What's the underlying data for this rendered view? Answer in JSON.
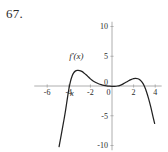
{
  "problem": {
    "number": "67."
  },
  "chart_data": {
    "type": "line",
    "title": "",
    "subtitle": "",
    "xlabel": "x",
    "ylabel": "",
    "curve_label": "f'(x)",
    "grid": false,
    "legend_position": "inline-left",
    "xlim": [
      -7.2,
      4.6
    ],
    "ylim": [
      -10.8,
      10.8
    ],
    "xticks": [
      -6,
      -4,
      -2,
      0,
      2,
      4
    ],
    "xtick_labels": [
      "-6",
      "-4",
      "-2",
      "0",
      "2",
      "4"
    ],
    "yticks": [
      -10,
      -5,
      0,
      5,
      10
    ],
    "ytick_labels": [
      "-10",
      "-5",
      "0",
      "5",
      "10"
    ],
    "annotations": [
      {
        "text": "f'(x)",
        "x": -3.3,
        "y": 5.0
      },
      {
        "text": "x",
        "x": -3.7,
        "y": -1.6
      }
    ],
    "series": [
      {
        "name": "f'(x)",
        "color": "#222222",
        "x": [
          -4.9,
          -4.8,
          -4.7,
          -4.6,
          -4.5,
          -4.4,
          -4.3,
          -4.2,
          -4.1,
          -4.0,
          -3.85,
          -3.7,
          -3.55,
          -3.4,
          -3.2,
          -3.0,
          -2.8,
          -2.6,
          -2.4,
          -2.2,
          -2.0,
          -1.75,
          -1.5,
          -1.25,
          -1.0,
          -0.75,
          -0.5,
          -0.25,
          0.0,
          0.25,
          0.5,
          0.75,
          1.0,
          1.25,
          1.5,
          1.75,
          2.0,
          2.2,
          2.4,
          2.6,
          2.8,
          3.0,
          3.2,
          3.4,
          3.6,
          3.8,
          3.95
        ],
        "y": [
          -10.2,
          -9.2,
          -8.2,
          -7.2,
          -6.2,
          -5.2,
          -4.1,
          -2.9,
          -1.7,
          -0.55,
          0.75,
          1.65,
          2.2,
          2.5,
          2.62,
          2.6,
          2.45,
          2.2,
          1.9,
          1.55,
          1.2,
          0.85,
          0.58,
          0.38,
          0.22,
          0.1,
          0.02,
          -0.03,
          -0.05,
          -0.05,
          0.0,
          0.12,
          0.32,
          0.58,
          0.85,
          1.08,
          1.25,
          1.3,
          1.22,
          1.0,
          0.6,
          -0.05,
          -1.0,
          -2.2,
          -3.6,
          -5.2,
          -6.3
        ]
      }
    ]
  }
}
